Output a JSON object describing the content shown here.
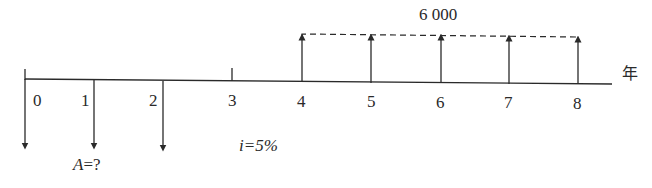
{
  "diagram": {
    "type": "cash-flow-diagram",
    "axis_unit_label": "年",
    "periods": [
      "0",
      "1",
      "2",
      "3",
      "4",
      "5",
      "6",
      "7",
      "8"
    ],
    "outflows": {
      "periods": [
        0,
        1,
        2
      ],
      "label": "A=?",
      "label_var": "A",
      "label_rest": "=?"
    },
    "inflows": {
      "periods": [
        4,
        5,
        6,
        7,
        8
      ],
      "amount_label": "6 000"
    },
    "interest_rate": {
      "label": "i=5%",
      "var": "i",
      "rest": "=5%"
    },
    "colors": {
      "line": "#2a2a2a",
      "background": "#ffffff"
    }
  }
}
